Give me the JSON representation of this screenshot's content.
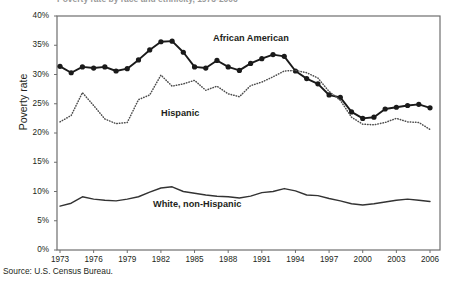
{
  "figure": {
    "title_cropped": "Poverty rate by race and ethnicity, 1973-2006",
    "source_note": "Source: U.S. Census Bureau."
  },
  "labels": {
    "african_american": "African American",
    "hispanic": "Hispanic",
    "white_non_hispanic": "White, non-Hispanic"
  },
  "colors": {
    "african_american": "#1a1a1a",
    "hispanic": "#4d4d4d",
    "white_non_hispanic": "#333333",
    "frame": "#6e6e6e",
    "text": "#231f20"
  },
  "chart_data": {
    "type": "line",
    "title": "",
    "xlabel": "",
    "ylabel": "Poverty rate",
    "xlim": [
      1973,
      2006
    ],
    "ylim": [
      0,
      40
    ],
    "grid": false,
    "legend_position": "inline-annotations",
    "ytick_labels": [
      "40%",
      "35%",
      "30%",
      "25%",
      "20%",
      "15%",
      "10%",
      "5%",
      "0%"
    ],
    "ytick_values": [
      40,
      35,
      30,
      25,
      20,
      15,
      10,
      5,
      0
    ],
    "xtick_labels": [
      "1973",
      "1976",
      "1979",
      "1982",
      "1985",
      "1988",
      "1991",
      "1994",
      "1997",
      "2000",
      "2003",
      "2006"
    ],
    "xtick_values": [
      1973,
      1976,
      1979,
      1982,
      1985,
      1988,
      1991,
      1994,
      1997,
      2000,
      2003,
      2006
    ],
    "x": [
      1973,
      1974,
      1975,
      1976,
      1977,
      1978,
      1979,
      1980,
      1981,
      1982,
      1983,
      1984,
      1985,
      1986,
      1987,
      1988,
      1989,
      1990,
      1991,
      1992,
      1993,
      1994,
      1995,
      1996,
      1997,
      1998,
      1999,
      2000,
      2001,
      2002,
      2003,
      2004,
      2005,
      2006
    ],
    "series": [
      {
        "name": "African American",
        "markers": true,
        "style": "solid",
        "values": [
          31.4,
          30.3,
          31.3,
          31.1,
          31.3,
          30.6,
          31.0,
          32.5,
          34.2,
          35.6,
          35.7,
          33.8,
          31.3,
          31.1,
          32.4,
          31.3,
          30.7,
          31.9,
          32.7,
          33.4,
          33.1,
          30.6,
          29.3,
          28.4,
          26.5,
          26.1,
          23.6,
          22.5,
          22.7,
          24.1,
          24.4,
          24.7,
          24.9,
          24.3
        ]
      },
      {
        "name": "Hispanic",
        "markers": false,
        "style": "dotted",
        "values": [
          21.9,
          23.0,
          26.9,
          24.7,
          22.4,
          21.6,
          21.8,
          25.7,
          26.5,
          29.9,
          28.0,
          28.4,
          29.0,
          27.3,
          28.0,
          26.7,
          26.2,
          28.1,
          28.7,
          29.6,
          30.6,
          30.7,
          30.3,
          29.4,
          27.1,
          25.6,
          22.7,
          21.5,
          21.4,
          21.8,
          22.5,
          21.9,
          21.8,
          20.6
        ]
      },
      {
        "name": "White, non-Hispanic",
        "markers": false,
        "style": "solid",
        "values": [
          7.5,
          8.0,
          9.1,
          8.7,
          8.5,
          8.4,
          8.7,
          9.1,
          9.9,
          10.6,
          10.8,
          10.0,
          9.7,
          9.4,
          9.2,
          9.1,
          8.9,
          9.2,
          9.8,
          10.0,
          10.5,
          10.1,
          9.4,
          9.3,
          8.8,
          8.4,
          7.9,
          7.7,
          7.9,
          8.2,
          8.5,
          8.7,
          8.5,
          8.3
        ]
      }
    ]
  }
}
